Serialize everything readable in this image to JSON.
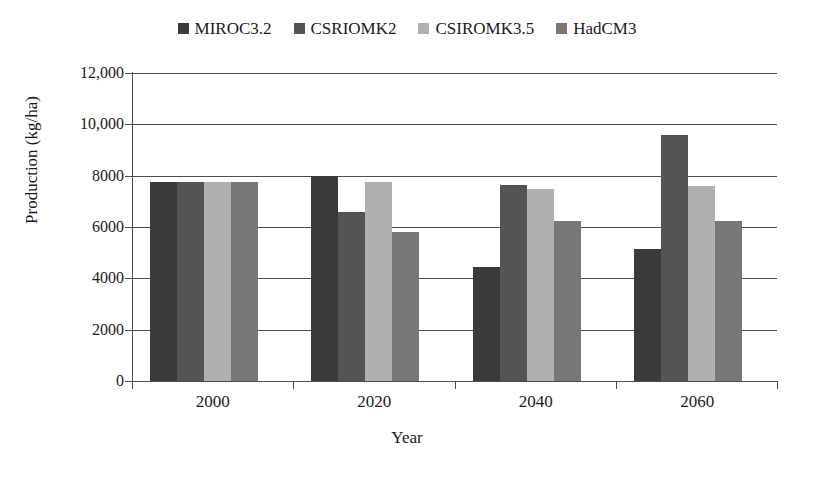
{
  "chart_data": {
    "type": "bar",
    "title": "",
    "xlabel": "Year",
    "ylabel": "Production (kg/ha)",
    "categories": [
      "2000",
      "2020",
      "2040",
      "2060"
    ],
    "ylim": [
      0,
      12000
    ],
    "ytick_values": [
      12000,
      10000,
      8000,
      6000,
      4000,
      2000,
      0
    ],
    "ytick_labels": [
      "12,000",
      "10,000",
      "8000",
      "6000",
      "4000",
      "2000",
      "0"
    ],
    "grid": true,
    "legend_position": "top-center",
    "series": [
      {
        "name": "MIROC3.2",
        "color": "#3a3a3a",
        "values": [
          7760,
          8000,
          4430,
          5150
        ]
      },
      {
        "name": "CSRIOMK2",
        "color": "#545454",
        "values": [
          7760,
          6600,
          7650,
          9600
        ]
      },
      {
        "name": "CSIROMK3.5",
        "color": "#b0b0b0",
        "values": [
          7760,
          7760,
          7500,
          7600
        ]
      },
      {
        "name": "HadCM3",
        "color": "#777777",
        "values": [
          7760,
          5800,
          6250,
          6250
        ]
      }
    ]
  },
  "axes": {
    "x_title": "Year",
    "y_title": "Production (kg/ha)"
  }
}
